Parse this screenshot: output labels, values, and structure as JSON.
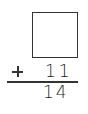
{
  "problem": {
    "type": "vertical-addition",
    "unknown_addend": "",
    "operator": "+",
    "addend": "11",
    "sum": "14"
  }
}
